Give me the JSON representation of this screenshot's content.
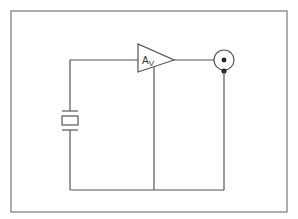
{
  "diagram": {
    "type": "circuit-schematic",
    "components": {
      "crystal": {
        "name": "crystal-oscillator",
        "symbol": "quartz-crystal"
      },
      "amplifier": {
        "name": "voltage-amplifier",
        "label_main": "A",
        "label_sub": "V"
      },
      "output_connector": {
        "name": "coaxial-output-connector",
        "symbol": "bnc-connector"
      }
    },
    "colors": {
      "wire": "#555555",
      "frame": "#777777",
      "background": "#ffffff"
    }
  }
}
